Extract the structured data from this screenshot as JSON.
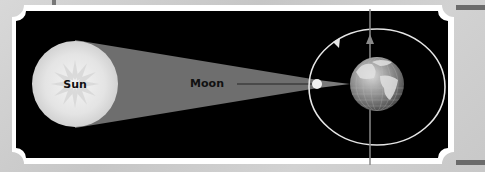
{
  "diagram": {
    "type": "solar eclipse geometry",
    "labels": {
      "sun": "Sun",
      "moon": "Moon"
    },
    "elements": [
      {
        "name": "sun",
        "shape": "circle",
        "color": "#e6e6e6"
      },
      {
        "name": "shadow-cone",
        "shape": "trapezoid",
        "color": "#6e6e6e"
      },
      {
        "name": "moon",
        "shape": "circle",
        "color": "#f0f0f0"
      },
      {
        "name": "earth",
        "shape": "globe",
        "color": "#9a9a9a"
      },
      {
        "name": "moon-orbit",
        "shape": "ellipse",
        "color": "#e0e0e0"
      },
      {
        "name": "earth-axis",
        "shape": "line-with-arrow",
        "color": "#8a8a8a"
      }
    ],
    "colors": {
      "panel_background": "#000000",
      "frame": "#ffffff",
      "page_background": "#cfcfcf"
    }
  }
}
